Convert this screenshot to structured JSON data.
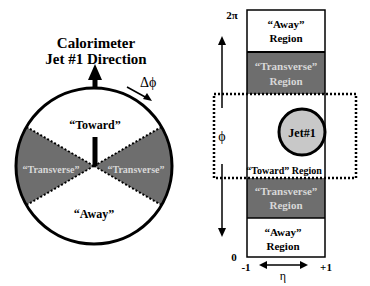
{
  "left_diagram": {
    "title_line1": "Calorimeter",
    "title_line2": "Jet #1 Direction",
    "delta_phi_label": "Δϕ",
    "regions": {
      "toward": "“Toward”",
      "transverse_left": "“Transverse”",
      "transverse_right": "“Transverse”",
      "away": "“Away”"
    }
  },
  "right_diagram": {
    "y_axis": {
      "label": "ϕ",
      "top_tick": "2π",
      "bottom_tick": "0"
    },
    "x_axis": {
      "label": "η",
      "left_tick": "-1",
      "right_tick": "+1"
    },
    "regions": [
      {
        "name": "away-top",
        "line1": "“Away”",
        "line2": "Region"
      },
      {
        "name": "transverse-top",
        "line1": "“Transverse”",
        "line2": "Region"
      },
      {
        "name": "toward",
        "line1": "“Toward” Region"
      },
      {
        "name": "transverse-bottom",
        "line1": "“Transverse”",
        "line2": "Region"
      },
      {
        "name": "away-bottom",
        "line1": "“Away”",
        "line2": "Region"
      }
    ],
    "jet_label": "Jet#1"
  },
  "colors": {
    "transverse_fill": "#6e6e6e",
    "jet_fill": "#c8c8c8",
    "line": "#000000",
    "transverse_text": "#d8d8d8"
  }
}
